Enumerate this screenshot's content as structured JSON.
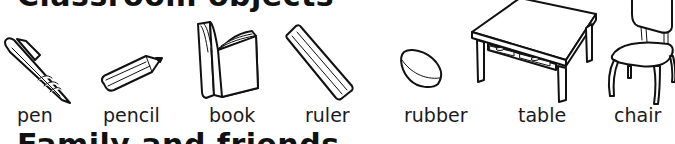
{
  "headings": {
    "top": "Classroom objects",
    "bottom": "Family and friends"
  },
  "items": [
    {
      "label": "pen",
      "icon": "pen-icon"
    },
    {
      "label": "pencil",
      "icon": "pencil-icon"
    },
    {
      "label": "book",
      "icon": "book-icon"
    },
    {
      "label": "ruler",
      "icon": "ruler-icon"
    },
    {
      "label": "rubber",
      "icon": "rubber-icon"
    },
    {
      "label": "table",
      "icon": "table-icon"
    },
    {
      "label": "chair",
      "icon": "chair-icon"
    }
  ]
}
